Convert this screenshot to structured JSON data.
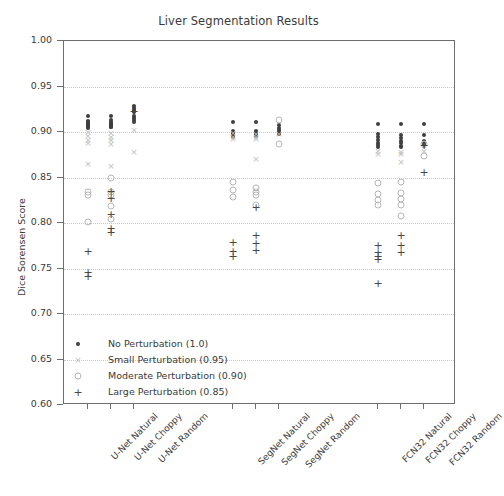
{
  "chart_data": {
    "type": "scatter",
    "title": "Liver Segmentation Results",
    "xlabel": "",
    "ylabel": "Dice Sorensen Score",
    "ylim": [
      0.6,
      1.0
    ],
    "yticks": [
      "1.00",
      "0.95",
      "0.90",
      "0.85",
      "0.80",
      "0.75",
      "0.70",
      "0.65",
      "0.60"
    ],
    "ytick_values": [
      1.0,
      0.95,
      0.9,
      0.85,
      0.8,
      0.75,
      0.7,
      0.65,
      0.6
    ],
    "grid": true,
    "legend_position": "lower left",
    "categories": [
      "U-Net Natural",
      "U-Net Choppy",
      "U-Net Random",
      "SegNet Natural",
      "SegNet Choppy",
      "SegNet Random",
      "FCN32 Natural",
      "FCN32 Choppy",
      "FCN32 Random"
    ],
    "legend": [
      {
        "label": "No Perturbation (1.0)",
        "marker": "dot",
        "color": "#3f3f3f"
      },
      {
        "label": "Small Perturbation (0.95)",
        "marker": "cross",
        "color": "#bdbdbd"
      },
      {
        "label": "Moderate Perturbation (0.90)",
        "marker": "circle",
        "color": "#b6b6b6"
      },
      {
        "label": "Large Perturbation (0.85)",
        "marker": "plus",
        "color": "#474747"
      }
    ],
    "series": [
      {
        "name": "No Perturbation (1.0)",
        "marker": "dot",
        "points": [
          {
            "category": "U-Net Natural",
            "values": [
              0.9175,
              0.9125,
              0.9105,
              0.9095,
              0.9085,
              0.9075,
              0.9065,
              0.9055,
              0.9045
            ]
          },
          {
            "category": "U-Net Choppy",
            "values": [
              0.918,
              0.913,
              0.911,
              0.91,
              0.909,
              0.908,
              0.907,
              0.906,
              0.905
            ]
          },
          {
            "category": "U-Net Random",
            "values": [
              0.929,
              0.9265,
              0.9245,
              0.923,
              0.9215,
              0.918,
              0.915,
              0.913,
              0.9115
            ]
          },
          {
            "category": "SegNet Natural",
            "values": [
              0.911,
              0.901,
              0.899,
              0.8975,
              0.896,
              0.895
            ]
          },
          {
            "category": "SegNet Choppy",
            "values": [
              0.9105,
              0.9015,
              0.8995,
              0.898,
              0.8965,
              0.8955
            ]
          },
          {
            "category": "SegNet Random",
            "values": [
              0.9075,
              0.9045,
              0.902,
              0.8995,
              0.8975
            ]
          },
          {
            "category": "FCN32 Natural",
            "values": [
              0.909,
              0.8975,
              0.894,
              0.891,
              0.888,
              0.8855,
              0.8835
            ]
          },
          {
            "category": "FCN32 Choppy",
            "values": [
              0.9085,
              0.897,
              0.8935,
              0.8905,
              0.8875,
              0.885,
              0.883
            ]
          },
          {
            "category": "FCN32 Random",
            "values": [
              0.909,
              0.8965,
              0.8905,
              0.887,
              0.8845
            ]
          }
        ]
      },
      {
        "name": "Small Perturbation (0.95)",
        "marker": "cross",
        "points": [
          {
            "category": "U-Net Natural",
            "values": [
              0.8995,
              0.8955,
              0.8915,
              0.8875,
              0.8645
            ]
          },
          {
            "category": "U-Net Choppy",
            "values": [
              0.899,
              0.895,
              0.891,
              0.887,
              0.863
            ]
          },
          {
            "category": "U-Net Random",
            "values": [
              0.902,
              0.8775
            ]
          },
          {
            "category": "SegNet Natural",
            "values": [
              0.8985,
              0.895,
              0.8925
            ]
          },
          {
            "category": "SegNet Choppy",
            "values": [
              0.898,
              0.8945,
              0.892,
              0.87
            ]
          },
          {
            "category": "SegNet Random",
            "values": [
              0.8975
            ]
          },
          {
            "category": "FCN32 Natural",
            "values": [
              0.879,
              0.876
            ]
          },
          {
            "category": "FCN32 Choppy",
            "values": [
              0.8785,
              0.8755,
              0.8675
            ]
          },
          {
            "category": "FCN32 Random",
            "values": [
              0.8795
            ]
          }
        ]
      },
      {
        "name": "Moderate Perturbation (0.90)",
        "marker": "circle",
        "points": [
          {
            "category": "U-Net Natural",
            "values": [
              0.834,
              0.8305,
              0.8015
            ]
          },
          {
            "category": "U-Net Choppy",
            "values": [
              0.8495,
              0.8345,
              0.831,
              0.819,
              0.804
            ]
          },
          {
            "category": "U-Net Random",
            "values": []
          },
          {
            "category": "SegNet Natural",
            "values": [
              0.8455,
              0.836,
              0.829
            ]
          },
          {
            "category": "SegNet Choppy",
            "values": [
              0.839,
              0.8345,
              0.831,
              0.82
            ]
          },
          {
            "category": "SegNet Random",
            "values": [
              0.913,
              0.887
            ]
          },
          {
            "category": "FCN32 Natural",
            "values": [
              0.8445,
              0.832,
              0.8255,
              0.8195
            ]
          },
          {
            "category": "FCN32 Choppy",
            "values": [
              0.845,
              0.833,
              0.8265,
              0.82,
              0.808
            ]
          },
          {
            "category": "FCN32 Random",
            "values": [
              0.887,
              0.8735
            ]
          }
        ]
      },
      {
        "name": "Large Perturbation (0.85)",
        "marker": "plus",
        "points": [
          {
            "category": "U-Net Natural",
            "values": [
              0.769,
              0.746,
              0.742
            ]
          },
          {
            "category": "U-Net Choppy",
            "values": [
              0.835,
              0.8275,
              0.81,
              0.795,
              0.79
            ]
          },
          {
            "category": "U-Net Random",
            "values": [
              0.9235
            ]
          },
          {
            "category": "SegNet Natural",
            "values": [
              0.779,
              0.769,
              0.764
            ]
          },
          {
            "category": "SegNet Choppy",
            "values": [
              0.818,
              0.787,
              0.778,
              0.77
            ]
          },
          {
            "category": "SegNet Random",
            "values": []
          },
          {
            "category": "FCN32 Natural",
            "values": [
              0.7755,
              0.768,
              0.764,
              0.76,
              0.7345
            ]
          },
          {
            "category": "FCN32 Choppy",
            "values": [
              0.787,
              0.776,
              0.7685
            ]
          },
          {
            "category": "FCN32 Random",
            "values": [
              0.886,
              0.8555
            ]
          }
        ]
      }
    ]
  }
}
